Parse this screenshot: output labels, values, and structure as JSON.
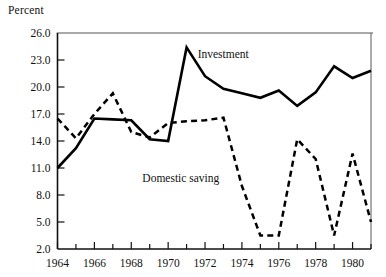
{
  "chart_data": {
    "type": "line",
    "title": "",
    "xlabel": "",
    "ylabel": "Percent",
    "ylim": [
      2.0,
      26.0
    ],
    "xlim": [
      1964,
      1981
    ],
    "ytick_labels": [
      "26.0",
      "23.0",
      "20.0",
      "17.0",
      "14.0",
      "11.0",
      "8.0",
      "5.0",
      "2.0"
    ],
    "ytick_values": [
      26.0,
      23.0,
      20.0,
      17.0,
      14.0,
      11.0,
      8.0,
      5.0,
      2.0
    ],
    "xtick_labels": [
      "1964",
      "1966",
      "1968",
      "1970",
      "1972",
      "1974",
      "1976",
      "1978",
      "1980"
    ],
    "xtick_values": [
      1964,
      1966,
      1968,
      1970,
      1972,
      1974,
      1976,
      1978,
      1980
    ],
    "x": [
      1964,
      1965,
      1966,
      1967,
      1968,
      1969,
      1970,
      1971,
      1972,
      1973,
      1974,
      1975,
      1976,
      1977,
      1978,
      1979,
      1980,
      1981
    ],
    "grid": false,
    "legend_position": "inline-annotation",
    "series": [
      {
        "name": "Investment",
        "style": "solid",
        "color": "#000000",
        "values": [
          11.0,
          13.2,
          16.5,
          16.4,
          16.3,
          14.2,
          14.0,
          24.4,
          21.2,
          19.8,
          19.3,
          18.8,
          19.6,
          17.9,
          19.4,
          22.3,
          21.0,
          21.8
        ]
      },
      {
        "name": "Domestic saving",
        "style": "dashed",
        "color": "#000000",
        "values": [
          16.5,
          14.3,
          17.0,
          19.3,
          15.0,
          14.4,
          16.0,
          16.2,
          16.3,
          16.6,
          9.0,
          3.5,
          3.5,
          14.2,
          12.0,
          3.5,
          12.6,
          5.0
        ]
      }
    ],
    "annotations": [
      {
        "text": "Investment",
        "x": 1971.6,
        "y": 23.2
      },
      {
        "text": "Domestic saving",
        "x": 1968.6,
        "y": 9.4
      }
    ]
  },
  "axis": {
    "unit_label": "Percent"
  }
}
